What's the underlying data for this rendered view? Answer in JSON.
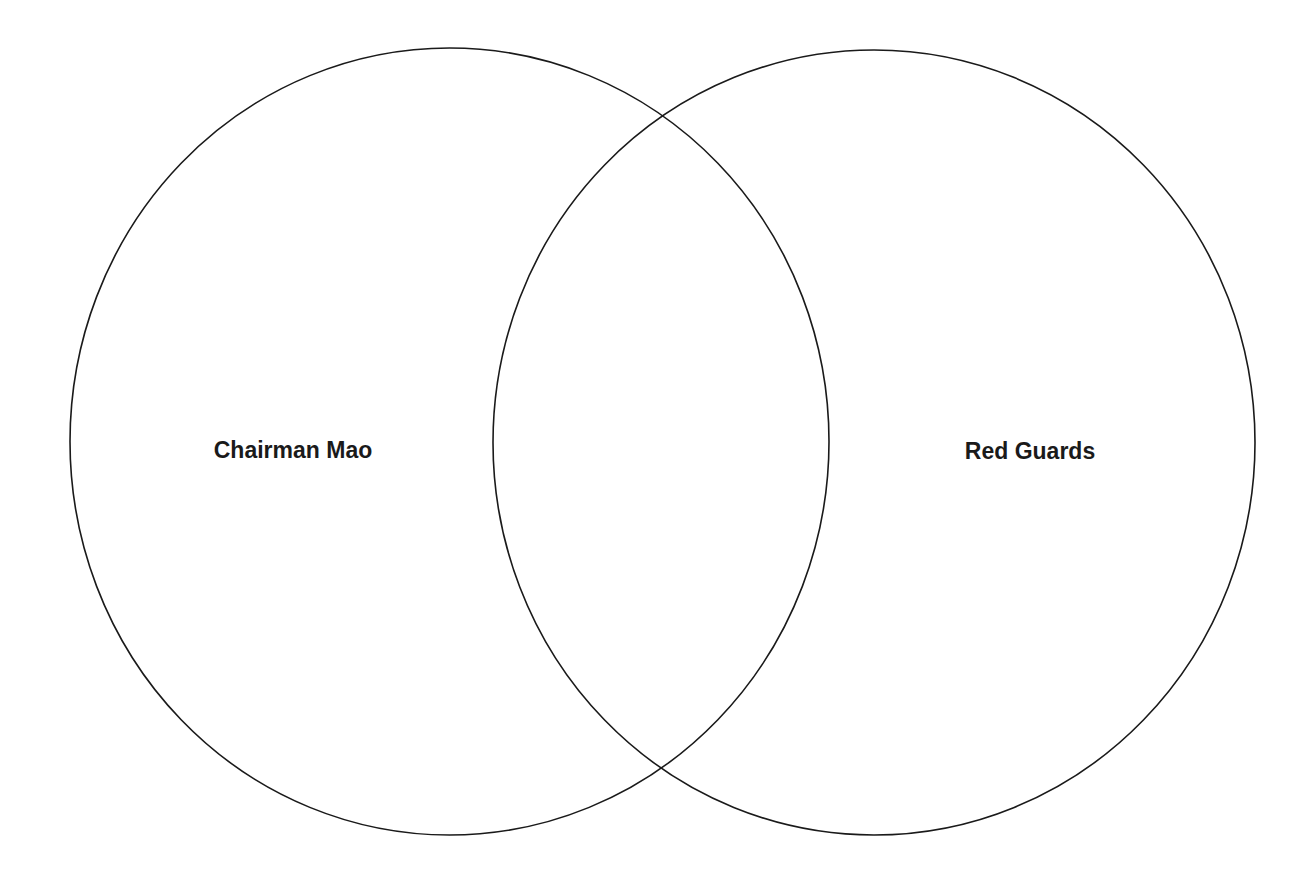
{
  "diagram": {
    "type": "venn",
    "stroke_color": "#1a1a1a",
    "background": "#ffffff",
    "sets": [
      {
        "id": "left",
        "label": "Chairman Mao",
        "shape": {
          "cx": 449.5,
          "cy": 441.5,
          "rx": 379.5,
          "ry": 393.5
        },
        "label_pos": {
          "x": 293,
          "y": 458
        }
      },
      {
        "id": "right",
        "label": "Red Guards",
        "shape": {
          "cx": 874,
          "cy": 442.5,
          "rx": 381,
          "ry": 392.5
        },
        "label_pos": {
          "x": 1030,
          "y": 459
        }
      }
    ],
    "overlap_label": ""
  }
}
